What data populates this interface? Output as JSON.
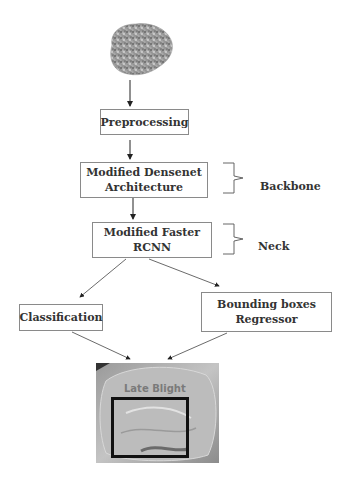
{
  "diagram": {
    "input": {
      "icon": "potato-leaf-image"
    },
    "nodes": [
      {
        "id": "preprocessing",
        "label": "Preprocessing"
      },
      {
        "id": "densenet",
        "label": "Modified Densenet\nArchitecture"
      },
      {
        "id": "faster_rcnn",
        "label": "Modified Faster\nRCNN"
      },
      {
        "id": "classification",
        "label": "Classification"
      },
      {
        "id": "bbox_regressor",
        "label": "Bounding boxes\nRegressor"
      }
    ],
    "groups": [
      {
        "label": "Backbone",
        "spans": "densenet"
      },
      {
        "label": "Neck",
        "spans": "faster_rcnn"
      }
    ],
    "output": {
      "label": "Late Blight",
      "detection": "bounding-box"
    },
    "edges": [
      [
        "input",
        "preprocessing"
      ],
      [
        "preprocessing",
        "densenet"
      ],
      [
        "densenet",
        "faster_rcnn"
      ],
      [
        "faster_rcnn",
        "classification"
      ],
      [
        "faster_rcnn",
        "bbox_regressor"
      ],
      [
        "classification",
        "output"
      ],
      [
        "bbox_regressor",
        "output"
      ]
    ]
  }
}
